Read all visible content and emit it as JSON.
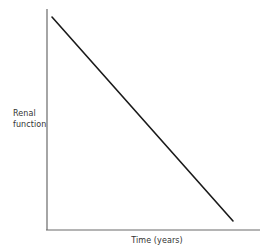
{
  "figure": {
    "background_color": "#ffffff",
    "width": 269,
    "height": 252
  },
  "chart_data": {
    "type": "line",
    "title": "",
    "xlabel": "Time (years)",
    "ylabel": "Renal function",
    "ylabel_line1": "Renal",
    "ylabel_line2": "function",
    "grid": false,
    "legend": null,
    "axis_color": "#6a6a6a",
    "line_color": "#1a1a1a",
    "line_width": 1.6,
    "xlim": [
      0,
      100
    ],
    "ylim": [
      0,
      100
    ],
    "x_ticks": [],
    "y_ticks": [],
    "series": [
      {
        "name": "Renal function decline",
        "x": [
          0,
          25,
          50,
          75,
          100
        ],
        "values": [
          100,
          75,
          50,
          25,
          0
        ]
      }
    ],
    "annotations": []
  },
  "geometry": {
    "y_axis_x": 47,
    "y_axis_top": 9,
    "y_axis_bottom": 230,
    "x_axis_y": 230,
    "x_axis_left": 46,
    "x_axis_right": 260,
    "line_start_x": 52,
    "line_start_y": 17,
    "line_end_x": 233,
    "line_end_y": 221
  }
}
